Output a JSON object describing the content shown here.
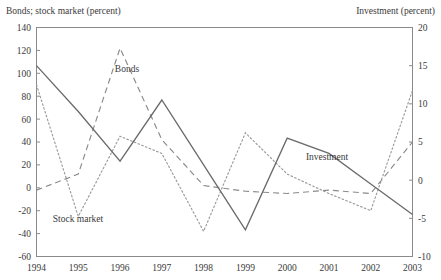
{
  "chart_data": {
    "type": "line",
    "title": "",
    "x": [
      1994,
      1995,
      1996,
      1997,
      1998,
      1999,
      2000,
      2001,
      2002,
      2003
    ],
    "categories": [
      "1994",
      "1995",
      "1996",
      "1997",
      "1998",
      "1999",
      "2000",
      "2001",
      "2002",
      "2003"
    ],
    "left_axis": {
      "label": "Bonds; stock market (percent)",
      "ylim": [
        -60,
        140
      ],
      "ticks": [
        140,
        120,
        100,
        80,
        60,
        40,
        20,
        0,
        -20,
        -40,
        -60
      ],
      "tick_labels": [
        "140",
        "120",
        "100",
        "80",
        "60",
        "40",
        "20",
        "0",
        "-20",
        "-40",
        "-60"
      ]
    },
    "right_axis": {
      "label": "Investment (percent)",
      "ylim": [
        -10,
        20
      ],
      "ticks": [
        20,
        15,
        10,
        5,
        0,
        -5,
        -10
      ],
      "tick_labels": [
        "20",
        "15",
        "10",
        "5",
        "0",
        "-5",
        "-10"
      ]
    },
    "xlabel": "",
    "grid": false,
    "legend": "inline-annotations",
    "series": [
      {
        "name": "Bonds",
        "axis": "left",
        "style": "dashed",
        "color": "#8a8a8a",
        "values": [
          -2,
          12,
          122,
          42,
          2,
          -3,
          -5,
          -2,
          -5,
          40
        ]
      },
      {
        "name": "Stock market",
        "axis": "left",
        "style": "dotted",
        "color": "#9a9a9a",
        "values": [
          90,
          -25,
          45,
          30,
          -38,
          48,
          12,
          -5,
          -20,
          85
        ]
      },
      {
        "name": "Investment",
        "axis": "right",
        "style": "solid",
        "color": "#6a6a6a",
        "values": [
          15,
          9,
          2.5,
          10.5,
          2,
          -6.5,
          5.5,
          3.5,
          -0.5,
          -4.5
        ]
      }
    ],
    "annotations": [
      {
        "text": "Bonds",
        "x_px": 127,
        "y_px": 72
      },
      {
        "text": "Stock  market",
        "x_px": 78,
        "y_px": 222
      },
      {
        "text": "Investment",
        "x_px": 327,
        "y_px": 160
      }
    ]
  }
}
